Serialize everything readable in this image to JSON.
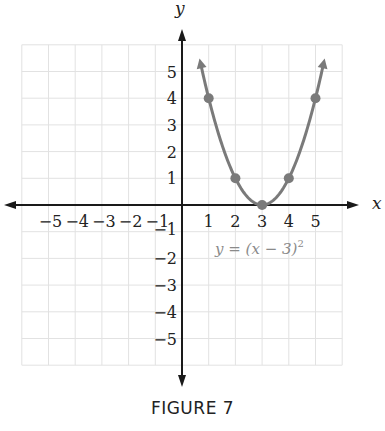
{
  "chart_data": {
    "type": "line",
    "title": "",
    "xlabel": "x",
    "ylabel": "y",
    "xlim": [
      -6,
      6
    ],
    "ylim": [
      -6,
      6
    ],
    "grid": true,
    "x_ticks": [
      -5,
      -4,
      -3,
      -2,
      -1,
      1,
      2,
      3,
      4,
      5
    ],
    "y_ticks": [
      -5,
      -4,
      -3,
      -2,
      -1,
      1,
      2,
      3,
      4,
      5
    ],
    "x_tick_labels": [
      "−5",
      "−4",
      "−3",
      "−2",
      "−1",
      "1",
      "2",
      "3",
      "4",
      "5"
    ],
    "y_tick_labels": [
      "−5",
      "−4",
      "−3",
      "−2",
      "−1",
      "1",
      "2",
      "3",
      "4",
      "5"
    ],
    "series": [
      {
        "name": "y = (x − 3)²",
        "equation": "y = (x - 3)^2",
        "color": "#7a7a7a",
        "points": [
          {
            "x": 1,
            "y": 4
          },
          {
            "x": 2,
            "y": 1
          },
          {
            "x": 3,
            "y": 0
          },
          {
            "x": 4,
            "y": 1
          },
          {
            "x": 5,
            "y": 4
          }
        ]
      }
    ],
    "annotations": [
      {
        "text": "y = (x − 3)²",
        "x": 3.5,
        "y": -1.7
      }
    ]
  },
  "labels": {
    "x_axis": "x",
    "y_axis": "y",
    "equation_main": "y = (x − 3)",
    "equation_exp": "2",
    "caption": "FIGURE 7"
  },
  "colors": {
    "axis": "#1a1a1a",
    "grid": "#e2e2e2",
    "curve": "#7a7a7a",
    "equation": "#8a8a8a"
  }
}
